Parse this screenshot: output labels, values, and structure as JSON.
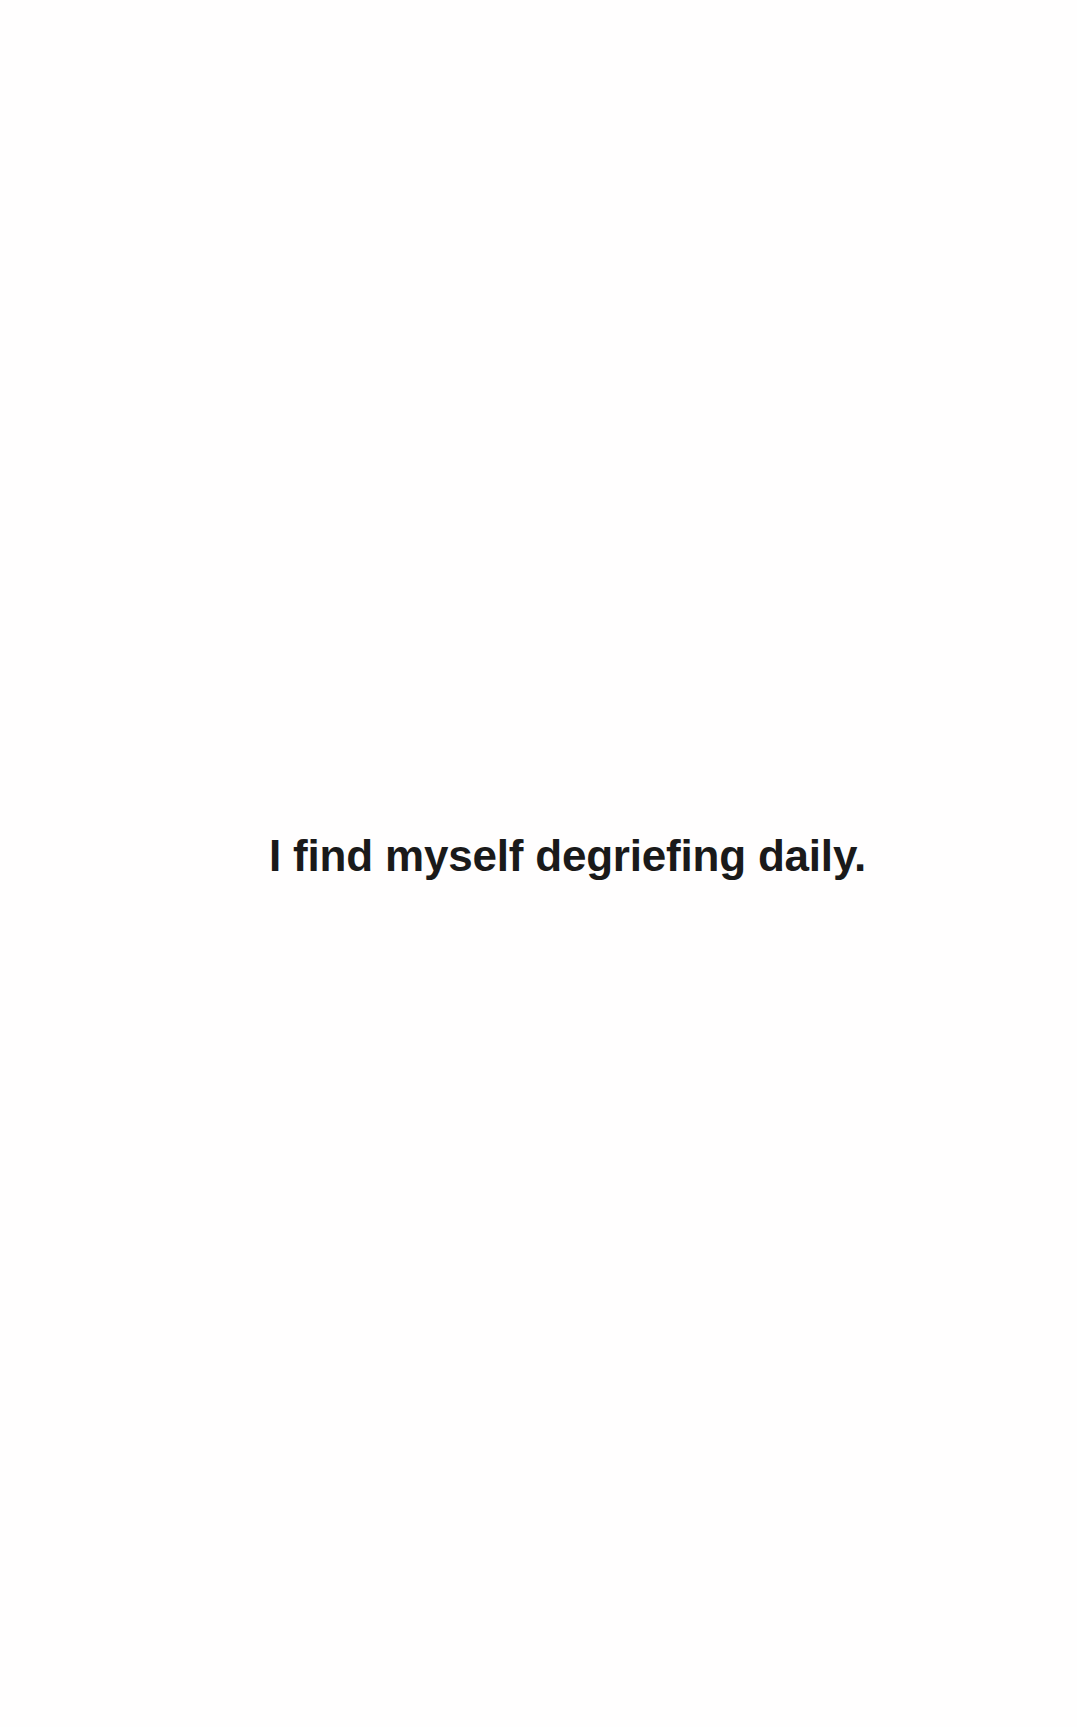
{
  "page": {
    "background_color": "#fffefe",
    "ink_color": "#1a1a1a"
  },
  "content": {
    "line": "I find myself degriefing daily."
  }
}
